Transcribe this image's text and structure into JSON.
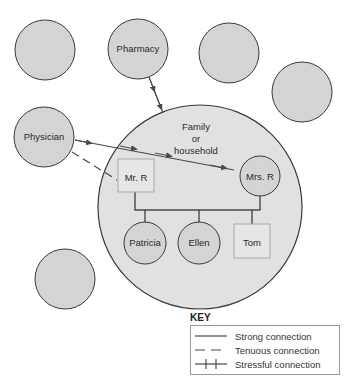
{
  "diagram": {
    "type": "ecomap",
    "colors": {
      "node_fill": "#d4d4d4",
      "node_stroke": "#3a3a3a",
      "household_fill": "#e1e1e1",
      "male_box_fill": "#e6e6e6",
      "male_box_stroke": "#a9a9a9",
      "line": "#4a4a4a"
    },
    "external_nodes": [
      {
        "id": "empty-1",
        "label": ""
      },
      {
        "id": "pharmacy",
        "label": "Pharmacy"
      },
      {
        "id": "empty-2",
        "label": ""
      },
      {
        "id": "empty-3",
        "label": ""
      },
      {
        "id": "physician",
        "label": "Physician"
      },
      {
        "id": "empty-4",
        "label": ""
      }
    ],
    "household": {
      "label_lines": [
        "Family",
        "or",
        "household"
      ],
      "members": [
        {
          "id": "mr-r",
          "label": "Mr. R",
          "shape": "square"
        },
        {
          "id": "mrs-r",
          "label": "Mrs. R",
          "shape": "circle"
        },
        {
          "id": "patricia",
          "label": "Patricia",
          "shape": "circle"
        },
        {
          "id": "ellen",
          "label": "Ellen",
          "shape": "circle"
        },
        {
          "id": "tom",
          "label": "Tom",
          "shape": "square"
        }
      ]
    },
    "connections": [
      {
        "from": "pharmacy",
        "to": "household",
        "type": "strong",
        "arrow": true
      },
      {
        "from": "physician",
        "to": "mrs-r",
        "type": "strong",
        "arrow": true
      },
      {
        "from": "physician",
        "to": "mr-r",
        "type": "tenuous",
        "arrow": false
      }
    ],
    "key": {
      "title": "KEY",
      "items": [
        {
          "type": "strong",
          "label": "Strong connection"
        },
        {
          "type": "tenuous",
          "label": "Tenuous connection"
        },
        {
          "type": "stressful",
          "label": "Stressful connection"
        }
      ]
    }
  }
}
